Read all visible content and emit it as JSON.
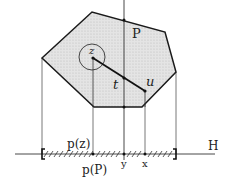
{
  "diagram": {
    "polygon_label": "P",
    "point_labels": {
      "z": "z",
      "t": "t",
      "u": "u",
      "y": "y",
      "x": "x"
    },
    "line_label": "H",
    "projection_labels": {
      "pz": "p(z)",
      "pP": "p(P)"
    },
    "colors": {
      "polygon_fill": "#d9d9d9",
      "stroke": "#1a1a1a",
      "thin_stroke": "#444444",
      "background": "#ffffff"
    }
  }
}
